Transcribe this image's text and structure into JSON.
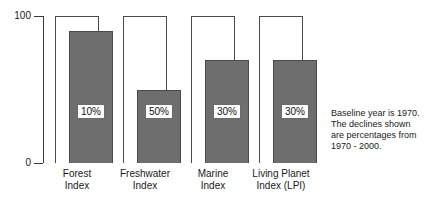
{
  "chart_data": {
    "type": "bar",
    "title": "",
    "subtitle": "",
    "xlabel": "",
    "ylabel": "",
    "ylim": [
      0,
      100
    ],
    "yticks": [
      "0",
      "100"
    ],
    "grid": false,
    "legend_position": "none",
    "categories": [
      "Forest Index",
      "Freshwater Index",
      "Marine Index",
      "Living Planet Index (LPI)"
    ],
    "series": [
      {
        "name": "1970 baseline",
        "values": [
          100,
          100,
          100,
          100
        ]
      },
      {
        "name": "2000 value",
        "values": [
          90,
          50,
          70,
          70
        ]
      }
    ],
    "data_labels": [
      "10%",
      "50%",
      "30%",
      "30%"
    ],
    "annotations": [
      "Baseline year is 1970.",
      "The declines shown",
      "are percentages from",
      "1970 - 2000."
    ],
    "colors": {
      "baseline_fill": "#ffffff",
      "baseline_stroke": "#4a4a4a",
      "current_fill": "#6e6e6e",
      "current_stroke": "#4a4a4a",
      "axis": "#3a3a3a",
      "text": "#1a1a1a"
    }
  },
  "axis": {
    "y_top_label": "100",
    "y_bottom_label": "0"
  },
  "groups": [
    {
      "label_line1": "Forest",
      "label_line2": "Index",
      "pct": "10%",
      "value": 90,
      "baseline": 100
    },
    {
      "label_line1": "Freshwater",
      "label_line2": "Index",
      "pct": "50%",
      "value": 50,
      "baseline": 100
    },
    {
      "label_line1": "Marine",
      "label_line2": "Index",
      "pct": "30%",
      "value": 70,
      "baseline": 100
    },
    {
      "label_line1": "Living Planet",
      "label_line2": "Index (LPI)",
      "pct": "30%",
      "value": 70,
      "baseline": 100
    }
  ],
  "annotation": {
    "line1": "Baseline year is 1970.",
    "line2": "The declines shown",
    "line3": "are percentages from",
    "line4": "1970 - 2000."
  }
}
